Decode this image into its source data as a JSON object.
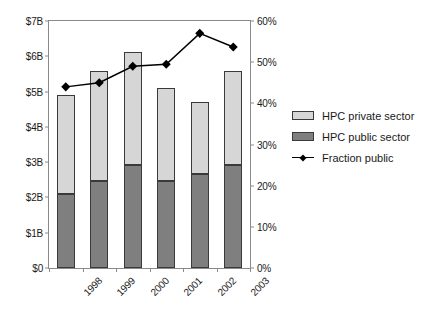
{
  "chart_data": {
    "type": "bar",
    "title": "",
    "xlabel": "",
    "ylabel": "",
    "y2label": "",
    "categories": [
      "1998",
      "1999",
      "2000",
      "2001",
      "2002",
      "2003"
    ],
    "ylim": [
      0,
      7
    ],
    "y2lim": [
      0,
      60
    ],
    "grid": false,
    "legend_position": "right",
    "y_tick_labels": [
      "$0",
      "$1B",
      "$2B",
      "$3B",
      "$4B",
      "$5B",
      "$6B",
      "$7B"
    ],
    "y_tick_values": [
      0,
      1,
      2,
      3,
      4,
      5,
      6,
      7
    ],
    "y2_tick_labels": [
      "0%",
      "10%",
      "20%",
      "30%",
      "40%",
      "50%",
      "60%"
    ],
    "y2_tick_values": [
      0,
      10,
      20,
      30,
      40,
      50,
      60
    ],
    "series": [
      {
        "name": "HPC public sector",
        "type": "bar",
        "stack": "total",
        "axis": "left",
        "color": "#7f7f7f",
        "values": [
          2.11,
          2.47,
          2.93,
          2.47,
          2.67,
          2.93
        ]
      },
      {
        "name": "HPC private sector",
        "type": "bar",
        "stack": "total",
        "axis": "left",
        "color": "#d6d6d6",
        "values": [
          2.78,
          3.11,
          3.2,
          2.63,
          2.03,
          2.65
        ]
      },
      {
        "name": "Fraction public",
        "type": "line",
        "axis": "right",
        "color": "#000000",
        "marker": "diamond",
        "values": [
          44.0,
          45.0,
          49.0,
          49.5,
          57.0,
          53.7
        ]
      }
    ],
    "bar_totals": [
      4.89,
      5.58,
      6.13,
      5.1,
      4.7,
      5.58
    ]
  },
  "legend": {
    "items": [
      {
        "label": "HPC private sector",
        "swatch": "private"
      },
      {
        "label": "HPC public sector",
        "swatch": "public"
      },
      {
        "label": "Fraction public",
        "swatch": "line"
      }
    ]
  }
}
